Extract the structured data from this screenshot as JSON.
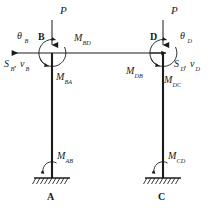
{
  "diagram": {
    "background_color": "#ffffff",
    "ink_color": "#1a1a1a",
    "joints": [
      {
        "name": "joint-b",
        "label": "B",
        "x": 52,
        "y": 53
      },
      {
        "name": "joint-d",
        "label": "D",
        "x": 163,
        "y": 53
      }
    ],
    "supports": [
      {
        "name": "support-a",
        "label": "A",
        "x": 52,
        "y": 178
      },
      {
        "name": "support-c",
        "label": "C",
        "x": 163,
        "y": 178
      }
    ],
    "loads": [
      {
        "name": "load-p-left",
        "label": "P",
        "x": 52,
        "y": 10
      },
      {
        "name": "load-p-right",
        "label": "P",
        "x": 163,
        "y": 10
      }
    ],
    "rotations": [
      {
        "name": "theta-b",
        "symbol": "θ",
        "subscript": "B"
      },
      {
        "name": "theta-d",
        "symbol": "θ",
        "subscript": "D"
      }
    ],
    "shears": [
      {
        "name": "shear-b",
        "force": "S",
        "force_sub": "B",
        "disp": "v",
        "disp_sub": "B",
        "separator": ", "
      },
      {
        "name": "shear-d",
        "force": "S",
        "force_sub": "D",
        "disp": "v",
        "disp_sub": "D",
        "separator": ", "
      }
    ],
    "moments": [
      {
        "name": "moment-bd",
        "symbol": "M",
        "subscript": "BD",
        "x": 78,
        "y": 41
      },
      {
        "name": "moment-ba",
        "symbol": "M",
        "subscript": "BA",
        "x": 60,
        "y": 80
      },
      {
        "name": "moment-db",
        "symbol": "M",
        "subscript": "DB",
        "x": 131,
        "y": 74
      },
      {
        "name": "moment-dc",
        "symbol": "M",
        "subscript": "DC",
        "x": 168,
        "y": 83
      },
      {
        "name": "moment-ab",
        "symbol": "M",
        "subscript": "AB",
        "x": 58,
        "y": 158
      },
      {
        "name": "moment-cd",
        "symbol": "M",
        "subscript": "CD",
        "x": 169,
        "y": 158
      }
    ],
    "members": [
      {
        "name": "column-ab",
        "from": "A",
        "to": "B"
      },
      {
        "name": "column-cd",
        "from": "C",
        "to": "D"
      },
      {
        "name": "beam-bd",
        "from": "B",
        "to": "D"
      }
    ]
  }
}
